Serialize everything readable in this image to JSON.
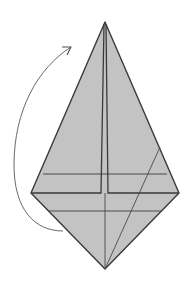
{
  "diagram": {
    "colors": {
      "paper_fill": "#c3c3c3",
      "edge_stroke": "#3a3a3a",
      "crease_stroke": "#4a4a4a",
      "arrow_stroke": "#6a6a6a",
      "background": "#ffffff"
    },
    "shape": {
      "top_apex": [
        105,
        22
      ],
      "left_corner": [
        31,
        193
      ],
      "right_corner": [
        179,
        193
      ],
      "bottom_apex": [
        105,
        269
      ]
    },
    "creases": {
      "center_left_flap": [
        [
          104,
          24
        ],
        [
          101,
          193
        ],
        [
          31,
          193
        ]
      ],
      "center_right_flap": [
        [
          106,
          24
        ],
        [
          108,
          193
        ],
        [
          179,
          193
        ]
      ],
      "upper_horizontal": [
        [
          43,
          174
        ],
        [
          167,
          174
        ]
      ],
      "lower_horizontal": [
        [
          49,
          211
        ],
        [
          161,
          211
        ]
      ],
      "center_lower_vertical": [
        [
          105,
          193
        ],
        [
          105,
          269
        ]
      ],
      "diagonal": [
        [
          160,
          147
        ],
        [
          105,
          269
        ]
      ]
    },
    "arrow": {
      "type": "curved-fold-arrow",
      "start": [
        63,
        231
      ],
      "end": [
        71,
        47
      ],
      "meaning": "Fold lower point up behind"
    }
  }
}
